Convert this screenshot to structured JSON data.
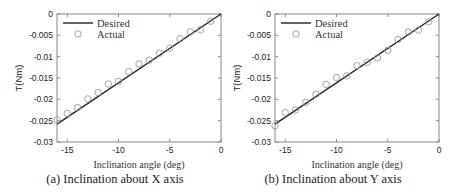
{
  "chart_data": [
    {
      "type": "scatter",
      "title": "",
      "caption": "(a) Inclination about X axis",
      "xlabel": "Inclination angle (deg)",
      "ylabel": "T(Nm)",
      "xlim": [
        -16,
        0
      ],
      "ylim": [
        -0.03,
        0
      ],
      "xticks": [
        -15,
        -10,
        -5,
        0
      ],
      "xtick_labels": [
        "-15",
        "-10",
        "-5",
        "0"
      ],
      "yticks": [
        0,
        -0.005,
        -0.01,
        -0.015,
        -0.02,
        -0.025,
        -0.03
      ],
      "ytick_labels": [
        "0",
        "-0.005",
        "-0.01",
        "-0.015",
        "-0.02",
        "-0.025",
        "-0.03"
      ],
      "grid": false,
      "legend_position": "upper left",
      "series": [
        {
          "name": "Desired",
          "type": "line",
          "color": "#222222",
          "x": [
            -16,
            0
          ],
          "y": [
            -0.0258,
            0
          ]
        },
        {
          "name": "Actual",
          "type": "scatter",
          "marker": "open-circle",
          "color": "#999999",
          "x": [
            -16,
            -15,
            -14,
            -13,
            -12,
            -11,
            -10,
            -9,
            -8,
            -7,
            -6,
            -5,
            -4,
            -3,
            -2,
            -1
          ],
          "y": [
            -0.0248,
            -0.0233,
            -0.0219,
            -0.0199,
            -0.0184,
            -0.0164,
            -0.0158,
            -0.0135,
            -0.0117,
            -0.0108,
            -0.0092,
            -0.008,
            -0.0058,
            -0.0042,
            -0.0037,
            -0.0017
          ]
        }
      ]
    },
    {
      "type": "scatter",
      "title": "",
      "caption": "(b) Inclination about Y axis",
      "xlabel": "Inclination angle (deg)",
      "ylabel": "T(Nm)",
      "xlim": [
        -16,
        0
      ],
      "ylim": [
        -0.03,
        0
      ],
      "xticks": [
        -15,
        -10,
        -5,
        0
      ],
      "xtick_labels": [
        "-15",
        "-10",
        "-5",
        "0"
      ],
      "yticks": [
        0,
        -0.005,
        -0.01,
        -0.015,
        -0.02,
        -0.025,
        -0.03
      ],
      "ytick_labels": [
        "0",
        "-0.005",
        "-0.01",
        "-0.015",
        "-0.02",
        "-0.025",
        "-0.03"
      ],
      "grid": false,
      "legend_position": "upper left",
      "series": [
        {
          "name": "Desired",
          "type": "line",
          "color": "#222222",
          "x": [
            -16,
            0
          ],
          "y": [
            -0.0258,
            0
          ]
        },
        {
          "name": "Actual",
          "type": "scatter",
          "marker": "open-circle",
          "color": "#999999",
          "x": [
            -16,
            -15,
            -14,
            -13,
            -12,
            -11,
            -10,
            -9,
            -8,
            -7,
            -6,
            -5,
            -4,
            -3,
            -2,
            -1
          ],
          "y": [
            -0.0262,
            -0.0231,
            -0.0225,
            -0.0207,
            -0.0188,
            -0.0165,
            -0.0149,
            -0.0145,
            -0.0121,
            -0.0113,
            -0.0103,
            -0.0085,
            -0.006,
            -0.0042,
            -0.0038,
            -0.0018
          ]
        }
      ]
    }
  ]
}
